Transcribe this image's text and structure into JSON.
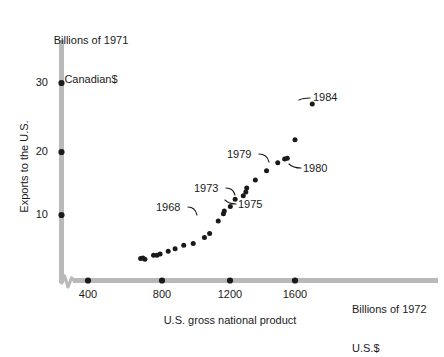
{
  "chart_data": {
    "type": "scatter",
    "title": "",
    "xlabel": "U.S. gross national product",
    "ylabel": "Exports to the U.S.",
    "x_unit_label": "Billions of 1972\nU.S.$",
    "y_unit_label": "Billions of 1971\nCanadian$",
    "xlim": [
      330,
      1750
    ],
    "ylim": [
      0,
      33
    ],
    "x_ticks": [
      400,
      800,
      1200,
      1600
    ],
    "y_ticks": [
      10,
      20,
      30
    ],
    "x_tick_labels": [
      "400",
      "800",
      "1200",
      "1600"
    ],
    "y_tick_labels": [
      "10",
      "20",
      "30"
    ],
    "grid": false,
    "legend": "none",
    "axis_break_x": true,
    "series": [
      {
        "name": "Canadian exports to the U.S.",
        "points": [
          {
            "year": 1956,
            "x": 705,
            "y": 3.4
          },
          {
            "year": 1957,
            "x": 718,
            "y": 3.5
          },
          {
            "year": 1958,
            "x": 730,
            "y": 3.3
          },
          {
            "year": 1959,
            "x": 780,
            "y": 3.9
          },
          {
            "year": 1960,
            "x": 800,
            "y": 3.9
          },
          {
            "year": 1961,
            "x": 818,
            "y": 4.1
          },
          {
            "year": 1962,
            "x": 865,
            "y": 4.5
          },
          {
            "year": 1963,
            "x": 905,
            "y": 4.9
          },
          {
            "year": 1964,
            "x": 955,
            "y": 5.4
          },
          {
            "year": 1965,
            "x": 1010,
            "y": 5.7
          },
          {
            "year": 1966,
            "x": 1075,
            "y": 6.6
          },
          {
            "year": 1967,
            "x": 1105,
            "y": 7.2
          },
          {
            "year": 1968,
            "x": 1155,
            "y": 9.1
          },
          {
            "year": 1969,
            "x": 1185,
            "y": 10.2
          },
          {
            "year": 1970,
            "x": 1190,
            "y": 10.6
          },
          {
            "year": 1971,
            "x": 1225,
            "y": 11.3
          },
          {
            "year": 1972,
            "x": 1253,
            "y": 12.4
          },
          {
            "year": 1973,
            "x": 1320,
            "y": 14.1
          },
          {
            "year": 1974,
            "x": 1315,
            "y": 13.5
          },
          {
            "year": 1975,
            "x": 1300,
            "y": 12.9
          },
          {
            "year": 1976,
            "x": 1370,
            "y": 15.3
          },
          {
            "year": 1977,
            "x": 1435,
            "y": 16.7
          },
          {
            "year": 1978,
            "x": 1500,
            "y": 17.9
          },
          {
            "year": 1979,
            "x": 1540,
            "y": 18.5
          },
          {
            "year": 1980,
            "x": 1555,
            "y": 18.6
          },
          {
            "year": 1981,
            "x": 1600,
            "y": 21.4
          },
          {
            "year": 1984,
            "x": 1700,
            "y": 26.8
          }
        ]
      }
    ],
    "annotations": [
      {
        "label": "1968",
        "target_x": 1155,
        "target_y": 9.1
      },
      {
        "label": "1973",
        "target_x": 1320,
        "target_y": 14.1
      },
      {
        "label": "1975",
        "target_x": 1300,
        "target_y": 12.9
      },
      {
        "label": "1979",
        "target_x": 1540,
        "target_y": 18.5
      },
      {
        "label": "1980",
        "target_x": 1555,
        "target_y": 18.6
      },
      {
        "label": "1984",
        "target_x": 1700,
        "target_y": 26.8
      }
    ]
  },
  "axis_colors": {
    "axis_line": "#b9b9b9",
    "point": "#1a1a1a",
    "text": "#1a1a1a",
    "background": "#ffffff"
  },
  "annotation_labels": {
    "a1968": "1968",
    "a1973": "1973",
    "a1975": "1975",
    "a1979": "1979",
    "a1980": "1980",
    "a1984": "1984"
  },
  "unit_labels": {
    "y_line1": "Billions of 1971",
    "y_line2": "Canadian$",
    "x_line1": "Billions of 1972",
    "x_line2": "U.S.$"
  },
  "axis_titles": {
    "x": "U.S. gross national product",
    "y": "Exports to the U.S."
  },
  "tick_labels": {
    "x": [
      "400",
      "800",
      "1200",
      "1600"
    ],
    "y": [
      "30",
      "20",
      "10"
    ]
  }
}
